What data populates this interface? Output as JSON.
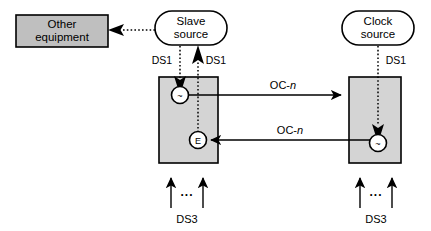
{
  "figure": {
    "type": "block-diagram",
    "background_color": "#ffffff",
    "line_color": "#000000",
    "fill_gray": "#bfbfbf",
    "fill_light_gray": "#d4d4d4",
    "node_fill": "#ffffff"
  },
  "nodes": {
    "other_equipment": {
      "label_line1": "Other",
      "label_line2": "equipment",
      "shape": "rectangle",
      "fill": "#bfbfbf"
    },
    "slave_source": {
      "label_line1": "Slave",
      "label_line2": "source",
      "shape": "rounded-rectangle",
      "fill": "#ffffff"
    },
    "clock_source": {
      "label_line1": "Clock",
      "label_line2": "source",
      "shape": "rounded-rectangle",
      "fill": "#ffffff"
    },
    "left_network_element": {
      "shape": "rectangle",
      "fill": "#d4d4d4"
    },
    "right_network_element": {
      "shape": "rectangle",
      "fill": "#d4d4d4"
    }
  },
  "ports": {
    "left_osc": {
      "symbol": "~",
      "name": "oscillator-port"
    },
    "left_ext": {
      "symbol": "E",
      "name": "external-timing-port"
    },
    "right_osc": {
      "symbol": "~",
      "name": "oscillator-port"
    }
  },
  "labels": {
    "ds1_left_out": "DS1",
    "ds1_left_in": "DS1",
    "ds1_right": "DS1",
    "oc_n_top_prefix": "OC-",
    "oc_n_top_suffix": "n",
    "oc_n_bottom_prefix": "OC-",
    "oc_n_bottom_suffix": "n",
    "ds3_left": "DS3",
    "ds3_right": "DS3",
    "ellipsis_left": "...",
    "ellipsis_right": "..."
  },
  "connections": [
    {
      "from": "slave_source",
      "to": "other_equipment",
      "style": "dotted",
      "arrow": "single",
      "direction": "left"
    },
    {
      "from": "slave_source",
      "to": "left_osc",
      "style": "dotted",
      "arrow": "single",
      "direction": "down",
      "label": "DS1"
    },
    {
      "from": "left_ext",
      "to": "slave_source",
      "style": "dotted",
      "arrow": "single",
      "direction": "up",
      "label": "DS1"
    },
    {
      "from": "clock_source",
      "to": "right_osc",
      "style": "dotted",
      "arrow": "single",
      "direction": "down",
      "label": "DS1"
    },
    {
      "from": "left_network_element",
      "to": "right_network_element",
      "style": "solid",
      "arrow": "single",
      "direction": "right",
      "label": "OC-n"
    },
    {
      "from": "right_network_element",
      "to": "left_ext",
      "style": "solid",
      "arrow": "single",
      "direction": "left",
      "label": "OC-n"
    },
    {
      "from": "ds3_left",
      "to": "left_network_element",
      "style": "solid",
      "arrow": "double-tributary",
      "direction": "up",
      "label": "DS3"
    },
    {
      "from": "ds3_right",
      "to": "right_network_element",
      "style": "solid",
      "arrow": "double-tributary",
      "direction": "up",
      "label": "DS3"
    }
  ]
}
